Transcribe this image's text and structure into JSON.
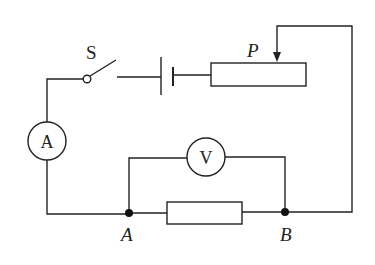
{
  "diagram": {
    "type": "electric-circuit",
    "colors": {
      "line": "#222222",
      "background": "#ffffff",
      "node": "#111111"
    },
    "labels": {
      "switch": "S",
      "slider": "P",
      "node_a": "A",
      "node_b": "B",
      "ammeter": "A",
      "voltmeter": "V"
    },
    "components": [
      {
        "id": "switch",
        "kind": "switch",
        "label": "S",
        "state": "open"
      },
      {
        "id": "battery",
        "kind": "battery"
      },
      {
        "id": "rheostat",
        "kind": "sliding-rheostat",
        "slider_label": "P"
      },
      {
        "id": "ammeter",
        "kind": "ammeter",
        "symbol": "A"
      },
      {
        "id": "voltmeter",
        "kind": "voltmeter",
        "symbol": "V",
        "connected_across": [
          "A",
          "B"
        ]
      },
      {
        "id": "resistor",
        "kind": "resistor",
        "between": [
          "A",
          "B"
        ]
      }
    ]
  }
}
